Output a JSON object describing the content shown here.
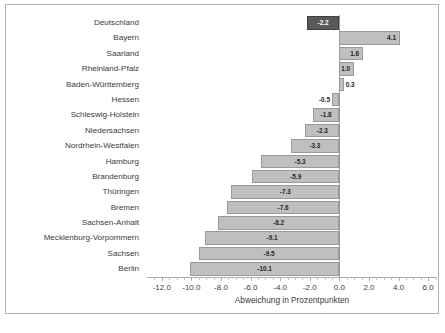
{
  "chart_data": {
    "type": "bar",
    "orientation": "horizontal",
    "title": "",
    "xlabel": "Abweichung in Prozentpunkten",
    "ylabel": "",
    "xlim": [
      -13.0,
      6.6
    ],
    "grid": false,
    "legend": null,
    "tick_labels": [
      "-12.0",
      "-10.0",
      "-8.0",
      "-6.0",
      "-4.0",
      "-2.0",
      "0.0",
      "2.0",
      "4.0",
      "6.0"
    ],
    "tick_values": [
      -12.0,
      -10.0,
      -8.0,
      -6.0,
      -4.0,
      -2.0,
      0.0,
      2.0,
      4.0,
      6.0
    ],
    "minor_tick_step": 0.5,
    "categories": [
      "Deutschland",
      "Bayern",
      "Saarland",
      "Rheinland-Pfalz",
      "Baden-Württemberg",
      "Hessen",
      "Schleswig-Holstein",
      "Niedersachsen",
      "Nordrhein-Westfalen",
      "Hamburg",
      "Brandenburg",
      "Thüringen",
      "Bremen",
      "Sachsen-Anhalt",
      "Mecklenburg-Vorpommern",
      "Sachsen",
      "Berlin"
    ],
    "values": [
      -2.2,
      4.1,
      1.6,
      1.0,
      0.3,
      -0.5,
      -1.8,
      -2.3,
      -3.3,
      -5.3,
      -5.9,
      -7.3,
      -7.6,
      -8.2,
      -9.1,
      -9.5,
      -10.1
    ],
    "value_labels": [
      "-2.2",
      "4.1",
      "1.6",
      "1.0",
      "0.3",
      "-0.5",
      "-1.8",
      "-2.3",
      "-3.3",
      "-5.3",
      "-5.9",
      "-7.3",
      "-7.6",
      "-8.2",
      "-9.1",
      "-9.5",
      "-10.1"
    ],
    "highlight_index": 0,
    "colors": {
      "bar": "#bfbfbf",
      "bar_highlight": "#595959",
      "bar_border": "#9a9a9a",
      "axis": "#aaaaaa",
      "text": "#3b3b3b",
      "label_on_dark": "#ffffff",
      "frame": "#b3b3b3"
    }
  },
  "footnote": ""
}
